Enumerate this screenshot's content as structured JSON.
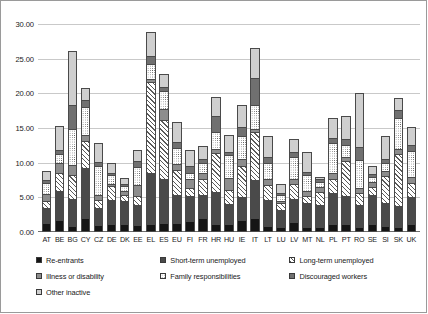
{
  "chart_data": {
    "type": "bar",
    "stacked": true,
    "title": "",
    "xlabel": "",
    "ylabel": "",
    "ylim": [
      0,
      30
    ],
    "yticks": [
      "0.00",
      "5.00",
      "10.00",
      "15.00",
      "20.00",
      "25.00",
      "30.00"
    ],
    "ytick_values": [
      0,
      5,
      10,
      15,
      20,
      25,
      30
    ],
    "grid": true,
    "legend_position": "bottom",
    "categories": [
      "AT",
      "BE",
      "BG",
      "CY",
      "CZ",
      "DE",
      "DK",
      "EE",
      "EL",
      "ES",
      "EU",
      "FI",
      "FR",
      "HR",
      "HU",
      "IE",
      "IT",
      "LT",
      "LU",
      "LV",
      "MT",
      "NL",
      "PL",
      "PT",
      "RO",
      "SE",
      "SI",
      "SK",
      "UK"
    ],
    "series": [
      {
        "name": "Re-entrants",
        "key": "reentrants",
        "pattern": "solid-black",
        "color": "#151515",
        "values": [
          1.0,
          1.4,
          0.6,
          1.8,
          0.7,
          0.8,
          0.9,
          0.7,
          0.9,
          1.0,
          1.0,
          1.3,
          1.7,
          0.8,
          0.9,
          1.5,
          1.7,
          0.6,
          0.4,
          1.2,
          0.5,
          0.4,
          0.8,
          0.8,
          0.5,
          0.9,
          0.6,
          0.5,
          0.8
        ]
      },
      {
        "name": "Short-term unemployed",
        "key": "short_term_unemployed",
        "pattern": "solid-dark-gray",
        "color": "#4a4a4a",
        "values": [
          2.2,
          4.2,
          3.9,
          7.1,
          2.5,
          3.6,
          3.3,
          2.9,
          7.3,
          6.4,
          4.1,
          3.6,
          3.4,
          4.7,
          2.8,
          3.3,
          5.5,
          3.8,
          2.5,
          3.3,
          3.4,
          3.2,
          4.5,
          4.1,
          3.1,
          4.1,
          3.3,
          3.0,
          4.0
        ]
      },
      {
        "name": "Long-term unemployed",
        "key": "long_term_unemployed",
        "pattern": "diagonal-hatch",
        "color": "#ffffff",
        "values": [
          1.0,
          2.6,
          3.4,
          4.0,
          1.2,
          1.9,
          0.8,
          1.3,
          13.2,
          8.5,
          3.5,
          1.1,
          2.2,
          5.6,
          2.1,
          4.5,
          6.9,
          2.1,
          1.0,
          2.2,
          1.0,
          1.9,
          2.1,
          5.0,
          1.7,
          1.2,
          3.9,
          7.4,
          2.0
        ]
      },
      {
        "name": "Illness or disability",
        "key": "illness_or_disability",
        "pattern": "solid-mid-gray",
        "color": "#8d8d8d",
        "values": [
          1.0,
          1.4,
          1.5,
          0.8,
          0.6,
          0.4,
          0.6,
          1.6,
          0.4,
          1.6,
          0.9,
          1.3,
          0.9,
          0.6,
          1.7,
          0.9,
          0.5,
          0.8,
          0.3,
          0.6,
          0.7,
          0.7,
          0.8,
          0.7,
          0.8,
          0.8,
          0.7,
          0.8,
          0.9
        ]
      },
      {
        "name": "Family responsibilities",
        "key": "family_responsibilities",
        "pattern": "dotted",
        "color": "#ffffff",
        "values": [
          1.6,
          1.3,
          5.2,
          4.1,
          4.2,
          1.2,
          0.8,
          2.6,
          2.1,
          2.5,
          2.3,
          0.9,
          1.4,
          2.5,
          3.3,
          3.3,
          3.4,
          2.3,
          0.9,
          3.2,
          2.4,
          0.8,
          4.4,
          1.7,
          4.0,
          0.6,
          1.2,
          4.5,
          3.7
        ]
      },
      {
        "name": "Discouraged workers",
        "key": "discouraged_workers",
        "pattern": "solid-gray",
        "color": "#707070",
        "values": [
          0.4,
          0.6,
          3.4,
          0.9,
          0.6,
          0.3,
          0.3,
          0.9,
          1.2,
          0.6,
          0.9,
          1.1,
          0.6,
          2.3,
          0.4,
          1.4,
          3.9,
          0.9,
          0.2,
          0.7,
          0.4,
          0.3,
          0.7,
          0.9,
          1.9,
          0.5,
          0.6,
          1.1,
          0.8
        ]
      },
      {
        "name": "Other inactive",
        "key": "other_inactive",
        "pattern": "solid-light-gray",
        "color": "#cfcfcf",
        "values": [
          1.3,
          3.5,
          7.8,
          1.8,
          2.7,
          1.5,
          0.8,
          1.6,
          3.5,
          1.9,
          2.9,
          2.3,
          1.9,
          2.7,
          2.5,
          3.2,
          4.3,
          3.1,
          1.4,
          2.0,
          2.9,
          0.4,
          2.8,
          3.2,
          7.7,
          1.1,
          3.3,
          1.8,
          2.6
        ]
      }
    ],
    "totals": [
      8.5,
      15.0,
      25.8,
      20.5,
      12.5,
      9.7,
      7.5,
      11.6,
      28.6,
      22.5,
      15.6,
      11.6,
      12.1,
      19.2,
      13.7,
      18.1,
      26.2,
      13.6,
      6.7,
      13.2,
      11.3,
      7.7,
      16.1,
      16.4,
      19.7,
      9.2,
      13.6,
      19.1,
      14.8
    ]
  },
  "legend": {
    "items": [
      {
        "label": "Re-entrants",
        "swatch": "solid-black"
      },
      {
        "label": "Short-term unemployed",
        "swatch": "solid-dark-gray"
      },
      {
        "label": "Long-term unemployed",
        "swatch": "diagonal-hatch"
      },
      {
        "label": "Illness or disability",
        "swatch": "solid-mid-gray"
      },
      {
        "label": "Family responsibilities",
        "swatch": "dotted"
      },
      {
        "label": "Discouraged workers",
        "swatch": "solid-gray"
      },
      {
        "label": "Other inactive",
        "swatch": "solid-light-gray"
      }
    ]
  }
}
